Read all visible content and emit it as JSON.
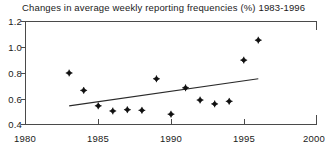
{
  "chart_data": {
    "type": "scatter",
    "title": "Changes in average weekly reporting frequencies (%) 1983-1996",
    "xlabel": "",
    "ylabel": "",
    "xlim": [
      1980,
      2000
    ],
    "ylim": [
      0.4,
      1.2
    ],
    "grid": false,
    "legend": null,
    "xticks": [
      1980,
      1985,
      1990,
      1995,
      2000
    ],
    "xtick_labels": [
      "1980",
      "1985",
      "1990",
      "1995",
      "2000"
    ],
    "yticks": [
      0.4,
      0.6,
      0.8,
      1.0,
      1.2
    ],
    "ytick_labels": [
      "0.4",
      "0.6",
      "0.8",
      "1.0",
      "1.2"
    ],
    "marker_style": "filled-diamond-plus",
    "marker_color": "#111111",
    "series": [
      {
        "name": "Average weekly reporting frequency change",
        "x": [
          1983,
          1984,
          1985,
          1986,
          1987,
          1988,
          1989,
          1990,
          1991,
          1992,
          1993,
          1994,
          1995,
          1996
        ],
        "values": [
          0.8,
          0.665,
          0.545,
          0.505,
          0.515,
          0.51,
          0.755,
          0.48,
          0.685,
          0.59,
          0.56,
          0.58,
          0.9,
          1.055
        ]
      }
    ],
    "trend_line": {
      "name": "Linear trend",
      "x": [
        1983,
        1996
      ],
      "values": [
        0.545,
        0.755
      ],
      "color": "#2a2a2a"
    }
  }
}
